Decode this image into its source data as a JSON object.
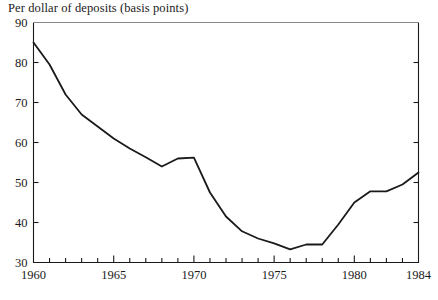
{
  "chart_data": {
    "type": "line",
    "title": "Per dollar of deposits (basis points)",
    "xlabel": "",
    "ylabel": "",
    "xlim": [
      1960,
      1984
    ],
    "ylim": [
      30,
      90
    ],
    "grid": false,
    "legend": null,
    "y_ticks": [
      30,
      40,
      50,
      60,
      70,
      80,
      90
    ],
    "y_tick_labels": [
      "30",
      "40",
      "50",
      "60",
      "70",
      "80",
      "90"
    ],
    "x_ticks": [
      1960,
      1965,
      1970,
      1975,
      1980,
      1984
    ],
    "x_tick_labels": [
      "1960",
      "1965",
      "1970",
      "1975",
      "1980",
      "1984"
    ],
    "x_minor_tick_step": 1,
    "line_color": "#1a1a1a",
    "line_width": 1.8,
    "x": [
      1960,
      1961,
      1962,
      1963,
      1964,
      1965,
      1966,
      1967,
      1968,
      1969,
      1970,
      1971,
      1972,
      1973,
      1974,
      1975,
      1976,
      1977,
      1978,
      1979,
      1980,
      1981,
      1982,
      1983,
      1984
    ],
    "values": [
      85.0,
      79.5,
      72.0,
      67.0,
      64.0,
      61.0,
      58.5,
      56.3,
      54.0,
      56.0,
      56.2,
      47.5,
      41.5,
      37.8,
      36.0,
      34.8,
      33.3,
      34.5,
      34.5,
      39.5,
      45.0,
      47.8,
      47.8,
      49.5,
      52.5
    ],
    "series": [
      {
        "name": "Per dollar of deposits",
        "values": [
          85.0,
          79.5,
          72.0,
          67.0,
          64.0,
          61.0,
          58.5,
          56.3,
          54.0,
          56.0,
          56.2,
          47.5,
          41.5,
          37.8,
          36.0,
          34.8,
          33.3,
          34.5,
          34.5,
          39.5,
          45.0,
          47.8,
          47.8,
          49.5,
          52.5
        ]
      }
    ]
  }
}
